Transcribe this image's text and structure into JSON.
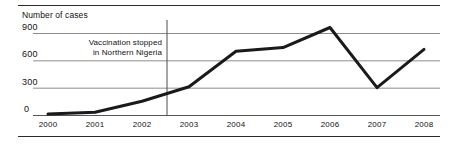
{
  "chart_data": {
    "type": "line",
    "title": "",
    "ylabel": "Number of cases",
    "xlabel": "",
    "categories": [
      "2000",
      "2001",
      "2002",
      "2003",
      "2004",
      "2005",
      "2006",
      "2007",
      "2008"
    ],
    "values": [
      10,
      30,
      150,
      310,
      700,
      740,
      960,
      300,
      720
    ],
    "yticks": [
      "0",
      "300",
      "600",
      "900"
    ],
    "ytick_values": [
      0,
      300,
      600,
      900
    ],
    "ylim": [
      0,
      1000
    ],
    "grid": true,
    "legend": false,
    "annotations": [
      {
        "text_line1": "Vaccination stopped",
        "text_line2": "in Northern Nigeria",
        "x_position": "2002.5",
        "marker": "vertical-line"
      }
    ],
    "line_color": "#1a1a1a",
    "grid_color": "#8c8c8c",
    "axis_color": "#2b2b2b"
  },
  "axis": {
    "title": "Number of cases"
  },
  "annotation": {
    "line1": "Vaccination stopped",
    "line2": "in Northern Nigeria"
  }
}
